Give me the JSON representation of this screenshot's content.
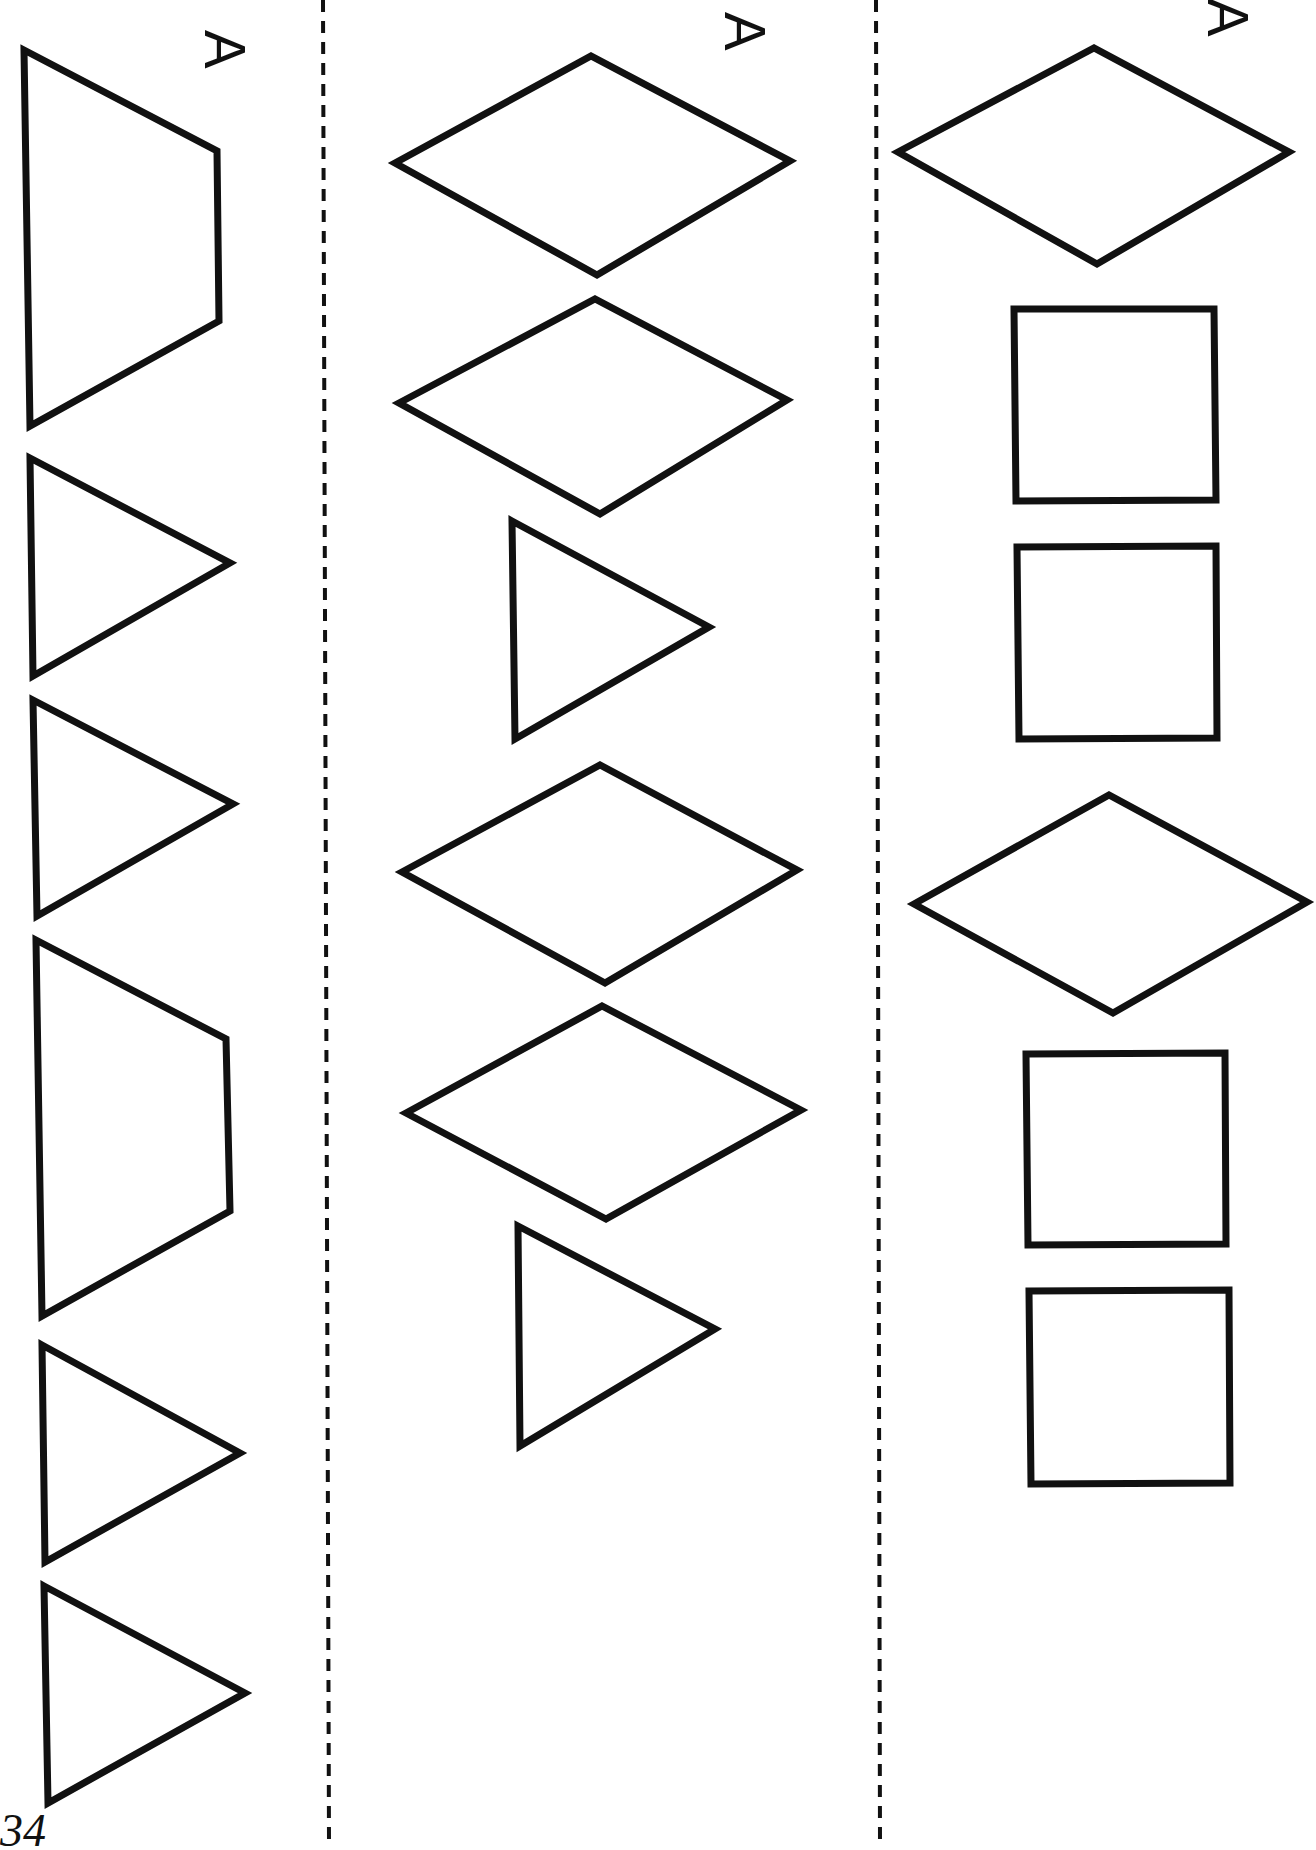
{
  "page": {
    "page_number": "34",
    "column_label": "A",
    "colors": {
      "stroke": "#111111",
      "background": "#ffffff"
    }
  },
  "columns": [
    {
      "label": "A",
      "shapes": [
        {
          "type": "trapezoid",
          "points": "24,50 217,151 219,321 30,426"
        },
        {
          "type": "triangle",
          "points": "30,458 230,563 33,676"
        },
        {
          "type": "triangle",
          "points": "33,700 233,804 37,916"
        },
        {
          "type": "trapezoid",
          "points": "36,940 226,1039 230,1211 42,1316"
        },
        {
          "type": "triangle",
          "points": "42,1345 240,1453 45,1562"
        },
        {
          "type": "triangle",
          "points": "44,1586 245,1693 48,1803"
        }
      ]
    },
    {
      "label": "A",
      "shapes": [
        {
          "type": "rhombus",
          "points": "395,163 591,56 790,161 597,275"
        },
        {
          "type": "rhombus",
          "points": "399,403 595,299 787,400 600,514"
        },
        {
          "type": "triangle",
          "points": "512,521 709,627 515,739"
        },
        {
          "type": "rhombus",
          "points": "402,872 600,765 797,870 605,983"
        },
        {
          "type": "rhombus",
          "points": "406,1113 602,1006 801,1110 606,1219"
        },
        {
          "type": "triangle",
          "points": "518,1226 715,1329 520,1446"
        }
      ]
    },
    {
      "label": "A",
      "shapes": [
        {
          "type": "rhombus",
          "points": "898,152 1094,48 1289,152 1097,264"
        },
        {
          "type": "square",
          "points": "1014,309 1214,309 1216,500 1016,501"
        },
        {
          "type": "square",
          "points": "1017,547 1216,546 1217,738 1019,739"
        },
        {
          "type": "rhombus",
          "points": "914,904 1109,795 1307,902 1113,1013"
        },
        {
          "type": "square",
          "points": "1026,1054 1225,1053 1226,1244 1028,1245"
        },
        {
          "type": "square",
          "points": "1029,1291 1229,1290 1230,1483 1031,1484"
        }
      ]
    }
  ]
}
